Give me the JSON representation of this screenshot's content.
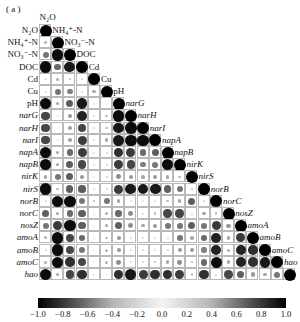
{
  "panel_label": "( a )",
  "chart_data": {
    "type": "heatmap",
    "subtype": "correlation-matrix-lower-triangle-circles",
    "variables": [
      "N2O",
      "NH4+-N",
      "NO3−-N",
      "DOC",
      "Cd",
      "Cu",
      "pH",
      "narG",
      "narH",
      "narI",
      "napA",
      "napB",
      "nirK",
      "nirS",
      "norB",
      "norC",
      "nosZ",
      "amoA",
      "amoB",
      "amoC",
      "hao"
    ],
    "variable_labels": [
      "N₂O",
      "NH₄⁺-N",
      "NO₃⁻-N",
      "DOC",
      "Cd",
      "Cu",
      "pH",
      "narG",
      "narH",
      "narI",
      "napA",
      "napB",
      "nirK",
      "nirS",
      "norB",
      "norC",
      "nosZ",
      "amoA",
      "amoB",
      "amoC",
      "hao"
    ],
    "italic_variables": [
      "narG",
      "narH",
      "narI",
      "napA",
      "napB",
      "nirK",
      "nirS",
      "norB",
      "norC",
      "nosZ",
      "amoA",
      "amoB",
      "amoC",
      "hao"
    ],
    "colorbar": {
      "min": -1.0,
      "max": 1.0,
      "ticks": [
        "-1.0",
        "-0.8",
        "-0.6",
        "-0.4",
        "-0.2",
        "0.0",
        "0.2",
        "0.4",
        "0.6",
        "0.8",
        "1.0"
      ],
      "low_color": "#000000",
      "mid_color": "#f4f4f4",
      "high_color": "#000000"
    },
    "matrix_abs_lower": [
      [
        1.0
      ],
      [
        0.2,
        1.0
      ],
      [
        0.5,
        0.95,
        1.0
      ],
      [
        0.95,
        0.55,
        0.9,
        1.0
      ],
      [
        0.1,
        0.25,
        0.2,
        0.1,
        1.0
      ],
      [
        0.1,
        0.5,
        0.45,
        0.1,
        0.3,
        1.0
      ],
      [
        0.95,
        0.3,
        0.6,
        0.9,
        0.05,
        0.0,
        1.0
      ],
      [
        0.7,
        0.05,
        0.35,
        0.85,
        0.1,
        0.2,
        0.95,
        1.0
      ],
      [
        0.7,
        0.05,
        0.3,
        0.7,
        0.1,
        0.2,
        0.9,
        0.95,
        1.0
      ],
      [
        0.7,
        0.05,
        0.3,
        0.75,
        0.1,
        0.3,
        0.9,
        0.95,
        0.95,
        1.0
      ],
      [
        0.95,
        0.3,
        0.55,
        0.75,
        0.05,
        0.1,
        0.8,
        0.75,
        0.55,
        0.6,
        1.0
      ],
      [
        0.95,
        0.3,
        0.6,
        0.7,
        0.05,
        0.1,
        0.75,
        0.7,
        0.45,
        0.5,
        0.95,
        1.0
      ],
      [
        0.3,
        0.5,
        0.6,
        0.35,
        0.0,
        0.1,
        0.4,
        0.35,
        0.3,
        0.35,
        0.3,
        0.2,
        1.0
      ],
      [
        0.95,
        0.2,
        0.6,
        0.6,
        0.1,
        0.1,
        0.75,
        0.9,
        0.9,
        0.9,
        0.6,
        0.5,
        0.2,
        1.0
      ],
      [
        0.1,
        0.95,
        0.95,
        0.5,
        0.2,
        0.5,
        0.3,
        0.05,
        0.05,
        0.05,
        0.2,
        0.3,
        0.6,
        0.1,
        1.0
      ],
      [
        0.6,
        0.3,
        0.55,
        0.6,
        0.0,
        0.25,
        0.55,
        0.4,
        0.1,
        0.2,
        0.7,
        0.7,
        0.1,
        0.3,
        0.2,
        1.0
      ],
      [
        0.5,
        0.75,
        0.95,
        0.6,
        0.0,
        0.3,
        0.6,
        0.4,
        0.3,
        0.35,
        0.5,
        0.5,
        0.6,
        0.5,
        0.75,
        0.35,
        1.0
      ],
      [
        0.25,
        0.95,
        0.7,
        0.55,
        0.0,
        0.2,
        0.35,
        0.1,
        0.1,
        0.1,
        0.1,
        0.5,
        0.3,
        0.55,
        0.85,
        0.3,
        0.75,
        1.0
      ],
      [
        0.1,
        0.95,
        0.7,
        0.5,
        0.0,
        0.25,
        0.35,
        0.1,
        0.1,
        0.1,
        0.1,
        0.35,
        0.35,
        0.45,
        0.85,
        0.25,
        0.85,
        0.8,
        1.0
      ],
      [
        0.25,
        0.95,
        0.8,
        0.7,
        0.0,
        0.25,
        0.4,
        0.1,
        0.1,
        0.2,
        0.3,
        0.4,
        0.2,
        0.55,
        0.95,
        0.3,
        0.85,
        0.8,
        0.9,
        1.0
      ],
      [
        0.95,
        0.3,
        0.7,
        0.8,
        0.05,
        0.0,
        0.8,
        0.9,
        0.75,
        0.8,
        0.8,
        0.75,
        0.2,
        0.8,
        0.1,
        0.7,
        0.6,
        0.35,
        0.3,
        0.5,
        1.0
      ]
    ],
    "title": "",
    "xlabel": "",
    "ylabel": "",
    "grid": true,
    "legend_position": "bottom colorbar"
  }
}
